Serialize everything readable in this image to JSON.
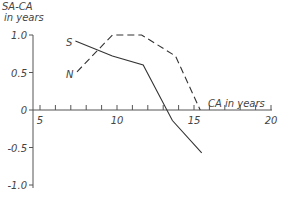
{
  "chart_data": {
    "type": "line",
    "title": "",
    "xlabel": "CA in years",
    "ylabel": "SA-CA in years",
    "xlim": [
      3.5,
      20
    ],
    "ylim": [
      -1.0,
      1.0
    ],
    "xticks": [
      5,
      10,
      15,
      20
    ],
    "yticks": [
      1.0,
      0.5,
      0,
      -0.5,
      -1.0
    ],
    "ytick_labels": [
      "1.0",
      "0.5",
      "0",
      "-0.5",
      "-1.0"
    ],
    "xtick_labels": [
      "5",
      "10",
      "15",
      "20"
    ],
    "grid": false,
    "legend": "inline labels",
    "series": [
      {
        "name": "S",
        "style": "solid",
        "x": [
          7.3,
          9.7,
          11.7,
          13.6,
          15.5
        ],
        "y": [
          0.92,
          0.72,
          0.6,
          -0.14,
          -0.57
        ]
      },
      {
        "name": "N",
        "style": "dashed",
        "x": [
          7.4,
          9.7,
          11.6,
          13.8,
          15.4
        ],
        "y": [
          0.51,
          1.0,
          1.0,
          0.72,
          0.0
        ]
      }
    ]
  },
  "labels": {
    "ylabel_line1": "SA-CA",
    "ylabel_line2": "in years",
    "xlabel": "CA  in  years",
    "series_S": "S",
    "series_N": "N"
  },
  "colors": {
    "line": "#333333",
    "text": "#444444"
  }
}
